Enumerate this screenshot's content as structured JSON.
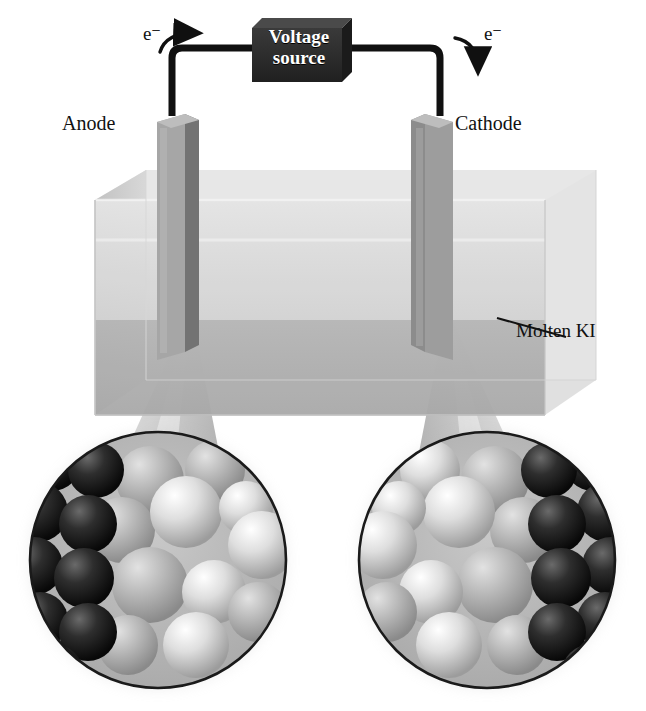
{
  "figure": {
    "kind": "electrolysis-cell-diagram",
    "palette": {
      "wire": "#101010",
      "voltage_box": "#2b2b2b",
      "voltage_box_top": "#4a4a4a",
      "voltage_text": "#ffffff",
      "electrode_light": "#9a9a9a",
      "electrode_dark": "#6e6e6e",
      "container_glass": "#e4e4e4",
      "liquid_upper": "#d8d8d8",
      "liquid_lower": "#a9a9a9",
      "cone": "#cfcfcf",
      "inset_outline": "#1a1a1a",
      "sphere_dark": "#1c1c1c",
      "sphere_light": "#e8e8e8",
      "sphere_mid": "#b4b4b4",
      "label_text": "#111111"
    }
  },
  "circuit": {
    "voltage_source_line1": "Voltage",
    "voltage_source_line2": "source",
    "electron_label_left": "e⁻",
    "electron_label_right": "e⁻",
    "electron_flow_left_direction": "right",
    "electron_flow_right_direction": "down"
  },
  "electrodes": {
    "anode_label": "Anode",
    "cathode_label": "Cathode"
  },
  "cell": {
    "electrolyte_label": "Molten KI"
  },
  "insets": [
    {
      "name": "anode-magnification",
      "electrode_side": "left",
      "dark_sphere_count": 9,
      "light_sphere_count": 11
    },
    {
      "name": "cathode-magnification",
      "electrode_side": "right",
      "dark_sphere_count": 9,
      "light_sphere_count": 11
    }
  ]
}
